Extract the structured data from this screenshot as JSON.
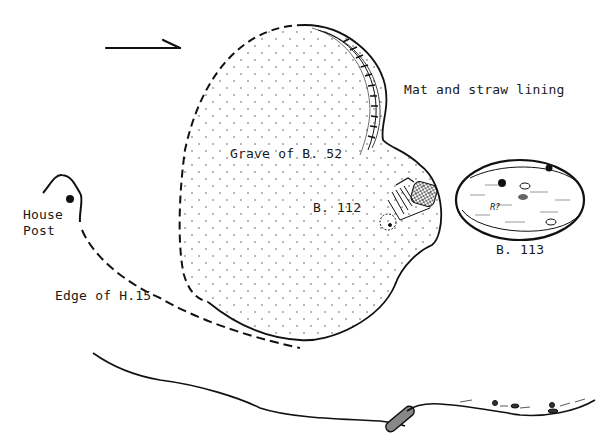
{
  "diagram": {
    "type": "archaeological-grave-plan",
    "ink_color": "#111111",
    "background_color": "#ffffff",
    "north_arrow": {
      "direction": "right"
    },
    "labels": {
      "mat_lining": "Mat and straw lining",
      "grave_b52": "Grave of B. 52",
      "b112": "B. 112",
      "b113": "B. 113",
      "house_post_line1": "House",
      "house_post_line2": "Post",
      "edge_h15": "Edge of H.15"
    },
    "features": [
      {
        "id": "grave-b52",
        "label": "Grave of B. 52",
        "outline": "dashed/solid",
        "fill": "stippled"
      },
      {
        "id": "burial-b112",
        "label": "B. 112",
        "content": "flexed skeleton"
      },
      {
        "id": "burial-b113",
        "label": "B. 113",
        "shape": "oval pit with grave goods"
      },
      {
        "id": "house-post",
        "label": "House Post",
        "marker": "filled circle"
      },
      {
        "id": "edge-h15",
        "label": "Edge of H.15",
        "outline": "dashed"
      },
      {
        "id": "section-profile",
        "label": "",
        "outline": "solid ground line"
      }
    ]
  }
}
